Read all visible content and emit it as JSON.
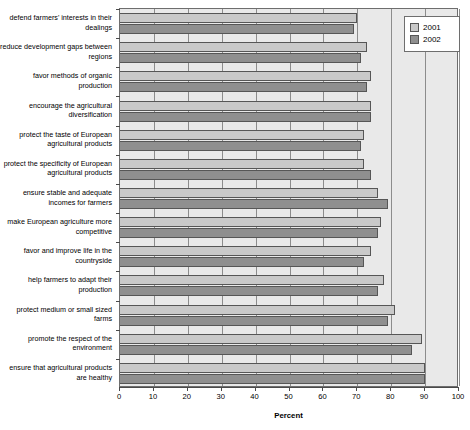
{
  "chart_data": {
    "type": "bar",
    "orientation": "horizontal",
    "title": "",
    "xlabel": "Percent",
    "ylabel": "",
    "xlim": [
      0,
      100
    ],
    "xticks": [
      0,
      10,
      20,
      30,
      40,
      50,
      60,
      70,
      80,
      90,
      100
    ],
    "grid": true,
    "legend_position": "top-right",
    "categories": [
      "defend farmers' interests in their dealings",
      "reduce development gaps between regions",
      "favor methods of organic production",
      "encourage the agricultural diversification",
      "protect the taste of European agricultural products",
      "protect the specificity of European agricultural products",
      "ensure stable and adequate incomes for farmers",
      "make European agriculture more competitive",
      "favor and improve life in the countryside",
      "help farmers to adapt their production",
      "protect medium or small sized farms",
      "promote the respect of the environment",
      "ensure that agricultural products are healthy"
    ],
    "series": [
      {
        "name": "2001",
        "color": "#c9c9c9",
        "values": [
          70,
          73,
          74,
          74,
          72,
          72,
          76,
          77,
          74,
          78,
          81,
          89,
          90
        ]
      },
      {
        "name": "2002",
        "color": "#8f8f8f",
        "values": [
          69,
          71,
          73,
          74,
          71,
          74,
          79,
          76,
          72,
          76,
          79,
          86,
          90
        ]
      }
    ]
  },
  "legend": {
    "entries": [
      {
        "label": "2001"
      },
      {
        "label": "2002"
      }
    ]
  },
  "axis": {
    "x_title": "Percent"
  }
}
